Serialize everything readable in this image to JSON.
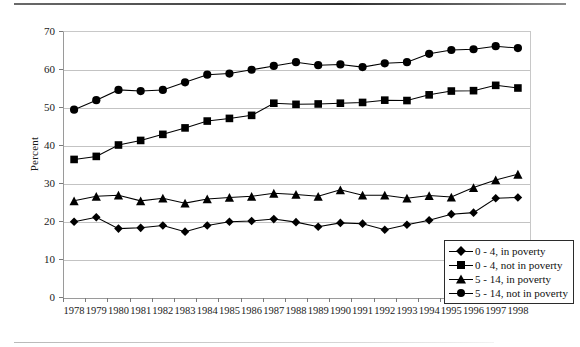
{
  "chart_data": {
    "type": "line",
    "title": "",
    "xlabel": "",
    "ylabel": "Percent",
    "ylim": [
      0,
      70
    ],
    "yticks": [
      0,
      10,
      20,
      30,
      40,
      50,
      60,
      70
    ],
    "grid": true,
    "legend_position": "bottom-right",
    "categories": [
      "1978",
      "1979",
      "1980",
      "1981",
      "1982",
      "1983",
      "1984",
      "1985",
      "1986",
      "1987",
      "1988",
      "1989",
      "1990",
      "1991",
      "1992",
      "1993",
      "1994",
      "1995",
      "1996",
      "1997",
      "1998"
    ],
    "series": [
      {
        "name": "0 - 4, in poverty",
        "marker": "diamond",
        "values": [
          19.8,
          21.0,
          18.0,
          18.2,
          18.8,
          17.2,
          18.8,
          19.8,
          20.0,
          20.5,
          19.7,
          18.5,
          19.5,
          19.3,
          17.7,
          19.0,
          20.2,
          21.8,
          22.2,
          26.0,
          26.2
        ]
      },
      {
        "name": "0 - 4, not in poverty",
        "marker": "square",
        "values": [
          36.2,
          37.0,
          40.0,
          41.2,
          42.8,
          44.5,
          46.3,
          47.0,
          47.8,
          51.0,
          50.7,
          50.8,
          51.0,
          51.2,
          51.8,
          51.7,
          53.2,
          54.2,
          54.3,
          55.7,
          55.0
        ]
      },
      {
        "name": "5 - 14, in poverty",
        "marker": "triangle",
        "values": [
          25.3,
          26.5,
          26.8,
          25.3,
          26.0,
          24.7,
          25.8,
          26.2,
          26.5,
          27.3,
          27.0,
          26.5,
          28.2,
          26.8,
          26.8,
          26.0,
          26.7,
          26.3,
          28.8,
          30.8,
          32.3
        ]
      },
      {
        "name": "5 - 14, not in poverty",
        "marker": "circle",
        "values": [
          49.3,
          51.8,
          54.5,
          54.2,
          54.5,
          56.5,
          58.5,
          58.8,
          59.8,
          60.8,
          61.8,
          61.0,
          61.2,
          60.5,
          61.5,
          61.8,
          64.0,
          65.0,
          65.2,
          66.0,
          65.5
        ]
      }
    ]
  },
  "legend": {
    "items": [
      {
        "label": "0 - 4, in poverty",
        "marker": "diamond"
      },
      {
        "label": "0 - 4, not in poverty",
        "marker": "square"
      },
      {
        "label": "5 - 14, in poverty",
        "marker": "triangle"
      },
      {
        "label": "5 - 14, not in poverty",
        "marker": "circle"
      }
    ]
  },
  "colors": {
    "series": "#000000",
    "grid": "#c3c3c3",
    "axis": "#8a8a8a",
    "text": "#1a1a1a",
    "background": "#ffffff"
  }
}
